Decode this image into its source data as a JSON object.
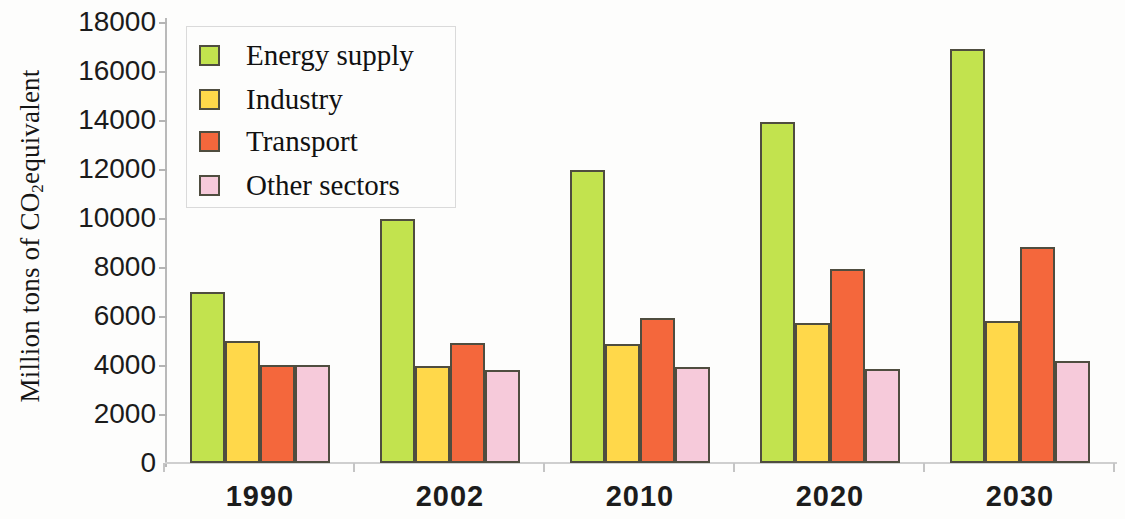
{
  "chart_data": {
    "type": "bar",
    "title": "",
    "xlabel": "",
    "ylabel": "Million tons of CO2equivalent",
    "ylabel_html": "Million tons of CO<sub>2</sub>equivalent",
    "categories": [
      "1990",
      "2002",
      "2010",
      "2020",
      "2030"
    ],
    "series": [
      {
        "name": "Energy supply",
        "color": "#c2e34e",
        "values": [
          7000,
          9950,
          11950,
          13900,
          16900
        ]
      },
      {
        "name": "Industry",
        "color": "#ffd84a",
        "values": [
          5000,
          3950,
          4850,
          5700,
          5800
        ]
      },
      {
        "name": "Transport",
        "color": "#f4673c",
        "values": [
          4000,
          4900,
          5900,
          7900,
          8800
        ]
      },
      {
        "name": "Other sectors",
        "color": "#f6cada",
        "values": [
          4000,
          3800,
          3900,
          3850,
          4150
        ]
      }
    ],
    "ylim": [
      0,
      18000
    ],
    "yticks": [
      18000,
      16000,
      14000,
      12000,
      10000,
      8000,
      6000,
      4000,
      2000,
      0
    ],
    "ytick_labels": [
      "18000",
      "16000",
      "14000",
      "12000",
      "10000",
      "8000",
      "6000",
      "4000",
      "2000",
      "0"
    ],
    "grid": false,
    "legend_position": "upper-left",
    "bar_outline_color": "#4f4d3f",
    "axis_color": "#b9b9b9"
  },
  "legend": {
    "items": [
      {
        "label": "Energy supply",
        "color": "#c2e34e"
      },
      {
        "label": "Industry",
        "color": "#ffd84a"
      },
      {
        "label": "Transport",
        "color": "#f4673c"
      },
      {
        "label": "Other sectors",
        "color": "#f6cada"
      }
    ]
  }
}
